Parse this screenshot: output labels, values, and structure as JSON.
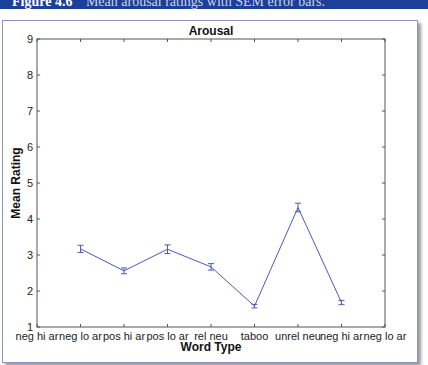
{
  "header": {
    "figure_number": "Figure 4.6",
    "caption": "Mean arousal ratings with SEM error bars."
  },
  "colors": {
    "header_bg": "#1c3f9a",
    "line": "#4a5ab8",
    "axis": "#555555"
  },
  "chart_data": {
    "type": "line",
    "title": "Arousal",
    "xlabel": "Word Type",
    "ylabel": "Mean Rating",
    "ylim": [
      1,
      9
    ],
    "xlim": [
      0,
      8
    ],
    "yticks": [
      1,
      2,
      3,
      4,
      5,
      6,
      7,
      8,
      9
    ],
    "xtick_labels": [
      "neg hi ar",
      "neg lo ar",
      "pos hi ar",
      "pos lo ar",
      "rel neu",
      "taboo",
      "unrel neu",
      "neg hi ar",
      "neg lo ar"
    ],
    "grid": false,
    "legend": null,
    "x": [
      1,
      2,
      3,
      4,
      5,
      6,
      7
    ],
    "series": [
      {
        "name": "Arousal",
        "values": [
          3.17,
          2.56,
          3.16,
          2.67,
          1.58,
          4.32,
          1.68
        ],
        "error": [
          0.1,
          0.08,
          0.12,
          0.09,
          0.05,
          0.12,
          0.06
        ]
      }
    ]
  }
}
